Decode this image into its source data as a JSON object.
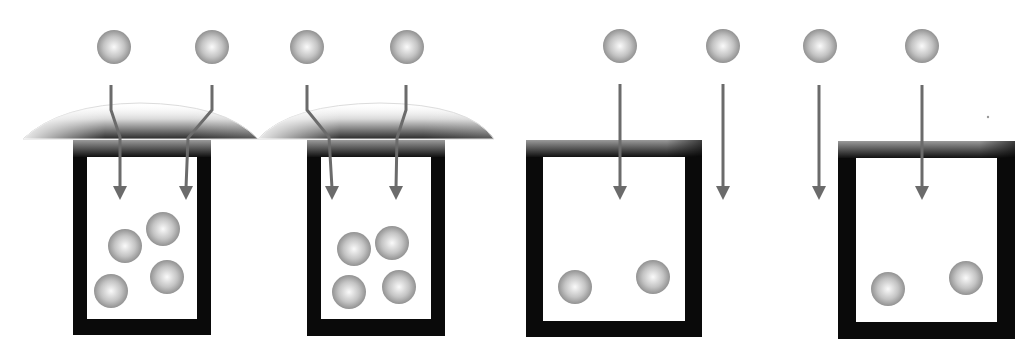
{
  "diagram": {
    "colors": {
      "ball_light": "#f4f4f4",
      "ball_dark": "#8a8a8a",
      "arrow": "#6b6b6b",
      "box": "#0a0a0a",
      "lens_dark": "#3a3a3a"
    },
    "panels": [
      {
        "id": "lens-1",
        "has_lens": true,
        "incoming_particles": 2,
        "collected_particles": 4
      },
      {
        "id": "lens-2",
        "has_lens": true,
        "incoming_particles": 2,
        "collected_particles": 4
      },
      {
        "id": "no-lens-1",
        "has_lens": false,
        "incoming_particles": 2,
        "collected_particles": 2
      },
      {
        "id": "no-lens-2",
        "has_lens": false,
        "incoming_particles": 2,
        "collected_particles": 2
      }
    ]
  }
}
